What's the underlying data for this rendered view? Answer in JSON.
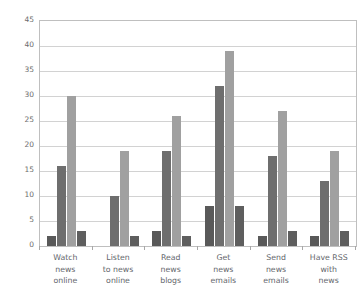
{
  "chart_data": {
    "type": "bar",
    "title": "",
    "xlabel": "",
    "ylabel": "",
    "ylim": [
      0,
      45
    ],
    "yticks": [
      0,
      5,
      10,
      15,
      20,
      25,
      30,
      35,
      40,
      45
    ],
    "grid": true,
    "legend": "none",
    "orientation": "vertical",
    "grouping": "clustered",
    "categories": [
      "Watch news online",
      "Listen to news online",
      "Read news blogs",
      "Get news emails",
      "Send news emails",
      "Have RSS with news"
    ],
    "category_lines": [
      [
        "Watch",
        "news",
        "online"
      ],
      [
        "Listen",
        "to news",
        "online"
      ],
      [
        "Read",
        "news",
        "blogs"
      ],
      [
        "Get",
        "news",
        "emails"
      ],
      [
        "Send",
        "news",
        "emails"
      ],
      [
        "Have RSS",
        "with",
        "news"
      ]
    ],
    "series": [
      {
        "name": "Series 1",
        "color": "#595959",
        "values": [
          2,
          0,
          3,
          8,
          2,
          2
        ]
      },
      {
        "name": "Series 2",
        "color": "#6e6e6e",
        "values": [
          16,
          10,
          19,
          32,
          18,
          13
        ]
      },
      {
        "name": "Series 3",
        "color": "#a0a0a0",
        "values": [
          30,
          19,
          26,
          39,
          27,
          19
        ]
      },
      {
        "name": "Series 4",
        "color": "#5e5e5e",
        "values": [
          3,
          2,
          2,
          8,
          3,
          3
        ]
      }
    ]
  },
  "axis": {
    "y_tick_labels": [
      "0",
      "5",
      "10",
      "15",
      "20",
      "25",
      "30",
      "35",
      "40",
      "45"
    ]
  },
  "colors": {
    "plot_border": "#bfbfbf",
    "gridline": "#d2d2d2",
    "tick_label": "#6d6d6d",
    "category_label": "#63666b",
    "background": "#ffffff"
  },
  "title_remnant": {
    "text": ""
  }
}
